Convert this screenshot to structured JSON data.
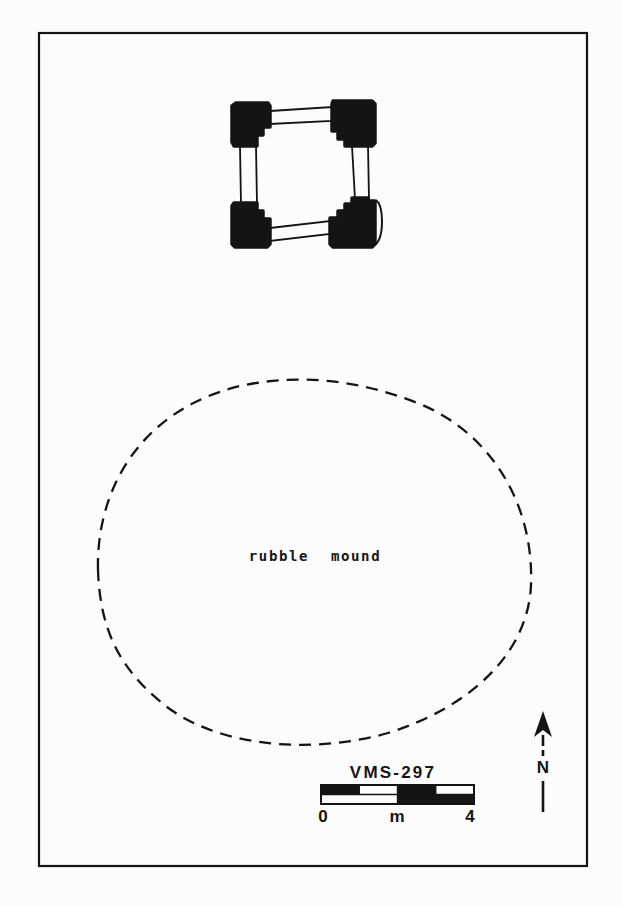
{
  "plan": {
    "mound": {
      "label": "rubble mound"
    },
    "north": {
      "label": "N"
    },
    "scale_bar": {
      "title": "VMS-297",
      "min_label": "0",
      "unit_label": "m",
      "max_label": "4",
      "units_total": 4,
      "pattern_top": [
        "ink",
        "paper",
        "ink",
        "paper"
      ],
      "pattern_bottom": [
        "paper",
        "paper",
        "ink",
        "ink"
      ]
    },
    "colors": {
      "ink": "#141414",
      "paper": "#fcfcfc"
    }
  }
}
